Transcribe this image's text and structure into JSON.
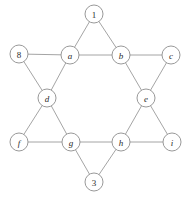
{
  "figure": {
    "type": "graph-diagram",
    "shape": "hexagram-star-of-david",
    "background_color": "#ffffff",
    "edge_color": "#9a9a9a",
    "node_fill": "#ffffff",
    "node_stroke": "#8d8d8d",
    "label_color": "#2b2b2b",
    "node_radius": 9
  },
  "chart_data": {
    "type": "graph",
    "title": "",
    "nodes": [
      {
        "id": "n1",
        "label": "1",
        "x": 94,
        "y": 14,
        "style": "upright",
        "role": "star-point-top"
      },
      {
        "id": "n8",
        "label": "8",
        "x": 19,
        "y": 54,
        "style": "upright",
        "role": "star-point-upper-left"
      },
      {
        "id": "na",
        "label": "a",
        "x": 70,
        "y": 55,
        "style": "italic",
        "role": "hexagon-upper-left"
      },
      {
        "id": "nb",
        "label": "b",
        "x": 121,
        "y": 55,
        "style": "italic",
        "role": "hexagon-upper-right"
      },
      {
        "id": "nc",
        "label": "c",
        "x": 171,
        "y": 55,
        "style": "italic",
        "role": "star-point-upper-right"
      },
      {
        "id": "nd",
        "label": "d",
        "x": 47,
        "y": 98,
        "style": "italic",
        "role": "hexagon-left"
      },
      {
        "id": "ne",
        "label": "e",
        "x": 146,
        "y": 98,
        "style": "italic",
        "role": "hexagon-right"
      },
      {
        "id": "nf",
        "label": "f",
        "x": 19,
        "y": 142,
        "style": "italic",
        "role": "star-point-lower-left"
      },
      {
        "id": "ng",
        "label": "g",
        "x": 71,
        "y": 142,
        "style": "italic",
        "role": "hexagon-lower-left"
      },
      {
        "id": "nh",
        "label": "h",
        "x": 121,
        "y": 142,
        "style": "italic",
        "role": "hexagon-lower-right"
      },
      {
        "id": "ni",
        "label": "i",
        "x": 172,
        "y": 142,
        "style": "italic",
        "role": "star-point-lower-right"
      },
      {
        "id": "n3",
        "label": "3",
        "x": 94,
        "y": 182,
        "style": "upright",
        "role": "star-point-bottom"
      }
    ],
    "edges": [
      {
        "from": "n1",
        "to": "na"
      },
      {
        "from": "n1",
        "to": "nb"
      },
      {
        "from": "n8",
        "to": "na"
      },
      {
        "from": "n8",
        "to": "nd"
      },
      {
        "from": "na",
        "to": "nb"
      },
      {
        "from": "na",
        "to": "nd"
      },
      {
        "from": "nb",
        "to": "nc"
      },
      {
        "from": "nb",
        "to": "ne"
      },
      {
        "from": "nc",
        "to": "ne"
      },
      {
        "from": "nd",
        "to": "nf"
      },
      {
        "from": "nd",
        "to": "ng"
      },
      {
        "from": "ne",
        "to": "nh"
      },
      {
        "from": "ne",
        "to": "ni"
      },
      {
        "from": "nf",
        "to": "ng"
      },
      {
        "from": "ng",
        "to": "nh"
      },
      {
        "from": "ng",
        "to": "n3"
      },
      {
        "from": "nh",
        "to": "ni"
      },
      {
        "from": "nh",
        "to": "n3"
      }
    ]
  }
}
